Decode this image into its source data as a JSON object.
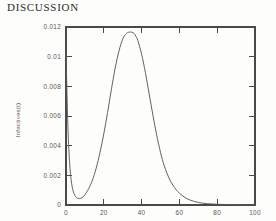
{
  "page": {
    "section_title": "DISCUSSION",
    "background_color": "#fdfdfb",
    "ink_color": "#4a4a4a"
  },
  "chart_data": {
    "type": "line",
    "title": "",
    "xlabel": "",
    "ylabel": "Infectives(t)",
    "xlim": [
      0,
      100
    ],
    "ylim": [
      0,
      0.0125
    ],
    "xticks": [
      0,
      20,
      40,
      60,
      80,
      100
    ],
    "xticklabels": [
      "0",
      "20",
      "40",
      "60",
      "80",
      "100"
    ],
    "yticks": [
      0,
      0.002,
      0.004,
      0.006,
      0.008,
      0.01,
      0.012
    ],
    "yticklabels": [
      "0",
      "0.002",
      "0.004",
      "0.006",
      "0.008",
      "0.01",
      "0.012"
    ],
    "grid": false,
    "legend": false,
    "frame": "box",
    "tick_direction": "in",
    "line_color": "#595959",
    "series": [
      {
        "name": "Infectives(t)",
        "x": [
          0,
          1,
          2,
          3,
          4,
          5,
          6,
          7,
          8,
          9,
          10,
          12,
          14,
          16,
          18,
          20,
          22,
          24,
          26,
          28,
          30,
          32,
          34,
          35,
          36,
          37,
          38,
          40,
          42,
          44,
          46,
          48,
          50,
          52,
          55,
          58,
          60,
          63,
          66,
          70,
          75,
          80,
          85,
          90,
          95,
          100
        ],
        "y": [
          0.0108,
          0.0055,
          0.0028,
          0.0015,
          0.0009,
          0.0006,
          0.00048,
          0.00045,
          0.00048,
          0.00057,
          0.00072,
          0.00115,
          0.00175,
          0.0026,
          0.0037,
          0.005,
          0.0065,
          0.0081,
          0.0096,
          0.0108,
          0.01165,
          0.01205,
          0.01215,
          0.01212,
          0.01205,
          0.01185,
          0.01155,
          0.0106,
          0.0093,
          0.0078,
          0.0063,
          0.0049,
          0.0037,
          0.00275,
          0.00175,
          0.00112,
          0.00083,
          0.00052,
          0.00033,
          0.00018,
          9e-05,
          5e-05,
          3e-05,
          2e-05,
          1e-05,
          1e-05
        ]
      }
    ],
    "annotations": {
      "peak_value": "0.0121",
      "peak_time": "36",
      "minimum_value": "0.00045",
      "minimum_time": "7"
    }
  }
}
